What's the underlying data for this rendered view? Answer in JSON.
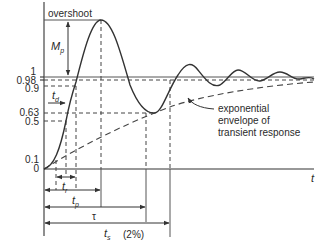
{
  "diagram": {
    "y_ticks": [
      {
        "label": "1",
        "y": 77
      },
      {
        "label": "0.98",
        "y": 80
      },
      {
        "label": "0.9",
        "y": 86
      },
      {
        "label": "0.63",
        "y": 113
      },
      {
        "label": "0.5",
        "y": 121
      },
      {
        "label": "0.1",
        "y": 160
      },
      {
        "label": "0",
        "y": 169
      }
    ],
    "x_axis_label": "t",
    "annotations": {
      "overshoot": "overshoot",
      "mp_main": "M",
      "mp_sub": "p",
      "td_main": "t",
      "td_sub": "d",
      "tr_main": "t",
      "tr_sub": "r",
      "tp_main": "t",
      "tp_sub": "p",
      "tau": "τ",
      "ts_main": "t",
      "ts_sub": "s",
      "ts_note": "(2%)",
      "envelope_line1": "exponential",
      "envelope_line2": "envelope of",
      "envelope_line3": "transient response"
    },
    "colors": {
      "line": "#333333",
      "background": "#ffffff"
    }
  }
}
